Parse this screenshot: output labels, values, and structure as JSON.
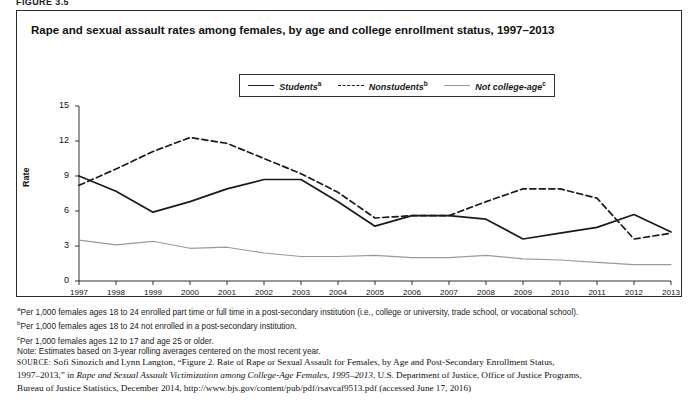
{
  "figure": {
    "label": "FIGURE 3.5",
    "title": "Rape and sexual assault rates among females, by age and college enrollment status, 1997–2013"
  },
  "legend": {
    "position": "top-center",
    "items": [
      {
        "label": "Students",
        "marker": "a",
        "style": "solid-dark",
        "color": "#1a1a1a"
      },
      {
        "label": "Nonstudents",
        "marker": "b",
        "style": "dashed-dark",
        "color": "#1a1a1a"
      },
      {
        "label": "Not college-age",
        "marker": "c",
        "style": "solid-light",
        "color": "#9a9a9a"
      }
    ]
  },
  "notes": {
    "a": "Per 1,000 females ages 18 to 24 enrolled part time or full time in a post-secondary institution (i.e., college or university, trade school, or vocational school).",
    "b": "Per 1,000 females ages 18 to 24 not enrolled in a post-secondary institution.",
    "c": "Per 1,000 females ages 12 to 17 and age 25 or older.",
    "note": "Note: Estimates based on 3-year rolling averages centered on the most recent year."
  },
  "source": {
    "prefix": "SOURCE:",
    "line1a": " Sofi Sinozich and Lynn Langton, “Figure 2. Rate of Rape or Sexual Assault for Females, by Age and Post-Secondary Enrollment Status,",
    "line2a": "1997–2013,” in ",
    "line2italic": "Rape and Sexual Assault Victimization among College-Age Females, 1995–2013",
    "line2b": ", U.S. Department of Justice, Office of Justice Programs,",
    "line3": "Bureau of Justice Statistics, December 2014, http://www.bjs.gov/content/pub/pdf/rsavcaf9513.pdf (accessed June 17, 2016)"
  },
  "chart_data": {
    "type": "line",
    "title": "Rape and sexual assault rates among females, by age and college enrollment status, 1997–2013",
    "xlabel": "",
    "ylabel": "Rate",
    "ylim": [
      0,
      15
    ],
    "yticks": [
      0,
      3,
      6,
      9,
      12,
      15
    ],
    "grid": false,
    "legend_position": "top-center",
    "categories": [
      "1997",
      "1998",
      "1999",
      "2000",
      "2001",
      "2002",
      "2003",
      "2004",
      "2005",
      "2006",
      "2007",
      "2008",
      "2009",
      "2010",
      "2011",
      "2012",
      "2013"
    ],
    "series": [
      {
        "name": "Students",
        "style": "solid-dark",
        "color": "#1a1a1a",
        "values": [
          9.0,
          7.7,
          5.9,
          6.8,
          7.9,
          8.7,
          8.7,
          6.8,
          4.7,
          5.6,
          5.6,
          5.3,
          3.6,
          4.1,
          4.6,
          5.7,
          4.2
        ]
      },
      {
        "name": "Nonstudents",
        "style": "dashed-dark",
        "color": "#1a1a1a",
        "values": [
          8.2,
          9.6,
          11.1,
          12.3,
          11.8,
          10.5,
          9.2,
          7.6,
          5.4,
          5.6,
          5.6,
          6.8,
          7.9,
          7.9,
          7.1,
          3.6,
          4.1
        ]
      },
      {
        "name": "Not college-age",
        "style": "solid-light",
        "color": "#9a9a9a",
        "values": [
          3.5,
          3.1,
          3.4,
          2.8,
          2.9,
          2.4,
          2.1,
          2.1,
          2.2,
          2.0,
          2.0,
          2.2,
          1.9,
          1.8,
          1.6,
          1.4,
          1.4
        ]
      }
    ]
  }
}
